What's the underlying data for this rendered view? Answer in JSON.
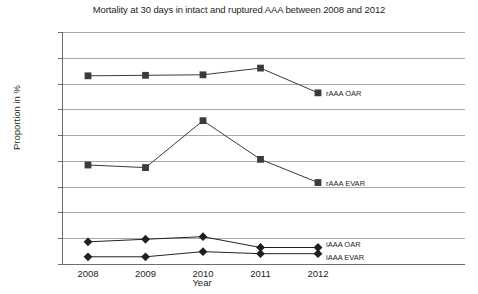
{
  "chart_data": {
    "type": "line",
    "title": "Mortality at 30 days in intact and ruptured AAA between 2008 and 2012",
    "xlabel": "Year",
    "ylabel": "Proportion in %",
    "categories": [
      "2008",
      "2009",
      "2010",
      "2011",
      "2012"
    ],
    "ytick_labels": [
      "45 %",
      "40 %",
      "35 %",
      "30 %",
      "25 %",
      "20 %",
      "15 %",
      "10 %",
      "5 %"
    ],
    "ytick_values": [
      45,
      40,
      35,
      30,
      25,
      20,
      15,
      10,
      5
    ],
    "ylim": [
      0,
      45
    ],
    "grid": true,
    "legend_position": "inline-right-of-last-point",
    "series": [
      {
        "name": "rAAA OAR",
        "marker": "square",
        "color": "#3b3b3b",
        "values": [
          36.5,
          36.6,
          36.7,
          38.0,
          33.2
        ]
      },
      {
        "name": "rAAA EVAR",
        "marker": "square",
        "color": "#3b3b3b",
        "values": [
          19.2,
          18.7,
          27.8,
          20.3,
          15.8
        ]
      },
      {
        "name": "iAAA OAR",
        "marker": "diamond",
        "color": "#231f20",
        "values": [
          4.3,
          4.8,
          5.3,
          3.2,
          3.2
        ]
      },
      {
        "name": "iAAA EVAR",
        "marker": "diamond",
        "color": "#231f20",
        "values": [
          1.4,
          1.4,
          2.4,
          2.0,
          2.0
        ]
      }
    ]
  }
}
